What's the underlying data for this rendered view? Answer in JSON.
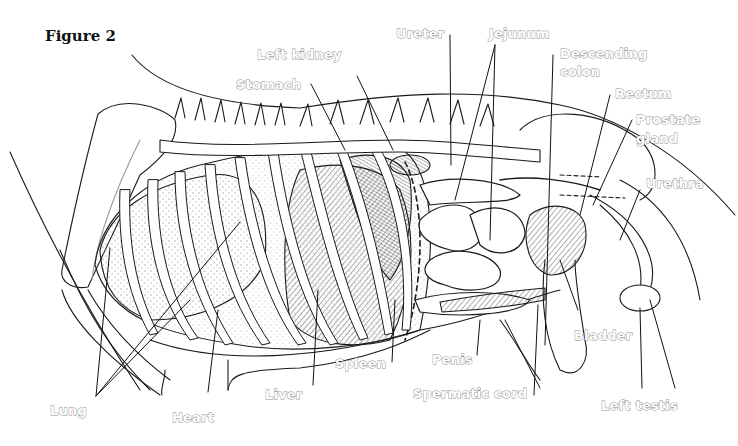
{
  "figure": {
    "title": "Figure 2",
    "label_style": {
      "fill": "#ffffff",
      "outline": "#8a8a8a",
      "leader_line": "#111111"
    }
  },
  "labels": {
    "left_kidney": "Left kidney",
    "stomach": "Stomach",
    "ureter": "Ureter",
    "jejunum": "Jejunum",
    "descending_colon_1": "Descending",
    "descending_colon_2": "colon",
    "rectum": "Rectum",
    "prostate_1": "Prostate",
    "prostate_2": "gland",
    "urethra": "Urethra",
    "bladder": "Bladder",
    "penis": "Penis",
    "spleen": "Spleen",
    "liver": "Liver",
    "heart": "Heart",
    "lung": "Lung",
    "spermatic_cord": "Spermatic cord",
    "left_testis": "Left testis"
  }
}
